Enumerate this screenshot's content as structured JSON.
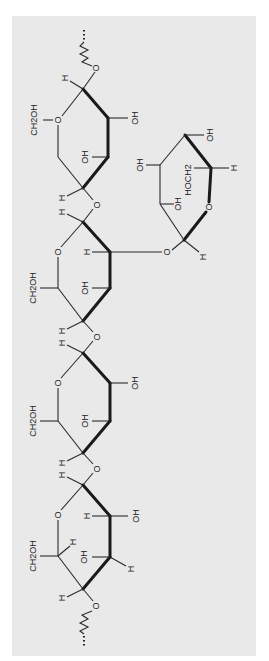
{
  "diagram": {
    "colors": {
      "panel": "#e9e9e9",
      "ink": "#222222",
      "background": "#ffffff"
    },
    "labels": {
      "r1_ch2oh": "CH2OH",
      "r1_oh_c2": "OH",
      "r1_oh_c3": "OH",
      "r1_h_c1": "H",
      "r1_o_ring": "O",
      "r1_o_glyc": "O",
      "r1_h_c4": "H",
      "link12_o": "O",
      "r2_h_c1": "H",
      "r2_o_ring": "O",
      "r2_h_c2": "H",
      "r2_ch2oh": "CH2OH",
      "r2_oh_c3": "OH",
      "r2_h_c4": "H",
      "link23_o": "O",
      "r3_h_c1": "H",
      "r3_o_ring": "O",
      "r3_oh_c2": "OH",
      "r3_ch2oh": "CH2OH",
      "r3_oh_c3": "OH",
      "r3_h_c4": "H",
      "link34_o": "O",
      "r4_h_c1": "H",
      "r4_o_ring": "O",
      "r4_h_c2": "H",
      "r4_oh_c2": "OH",
      "r4_ch2oh": "CH2OH",
      "r4_h_c5": "H",
      "r4_oh_c3": "OH",
      "r4_h_c3b": "H",
      "r4_h_c4": "H",
      "r4_o_glyc": "O",
      "br_o_link": "O",
      "br_h_c1": "H",
      "br_o_ring": "O",
      "br_oh_c2": "OH",
      "br_oh_c3": "OH",
      "br_oh_c4": "OH",
      "br_hoch2": "HOCH2",
      "br_h_c5": "H"
    }
  }
}
